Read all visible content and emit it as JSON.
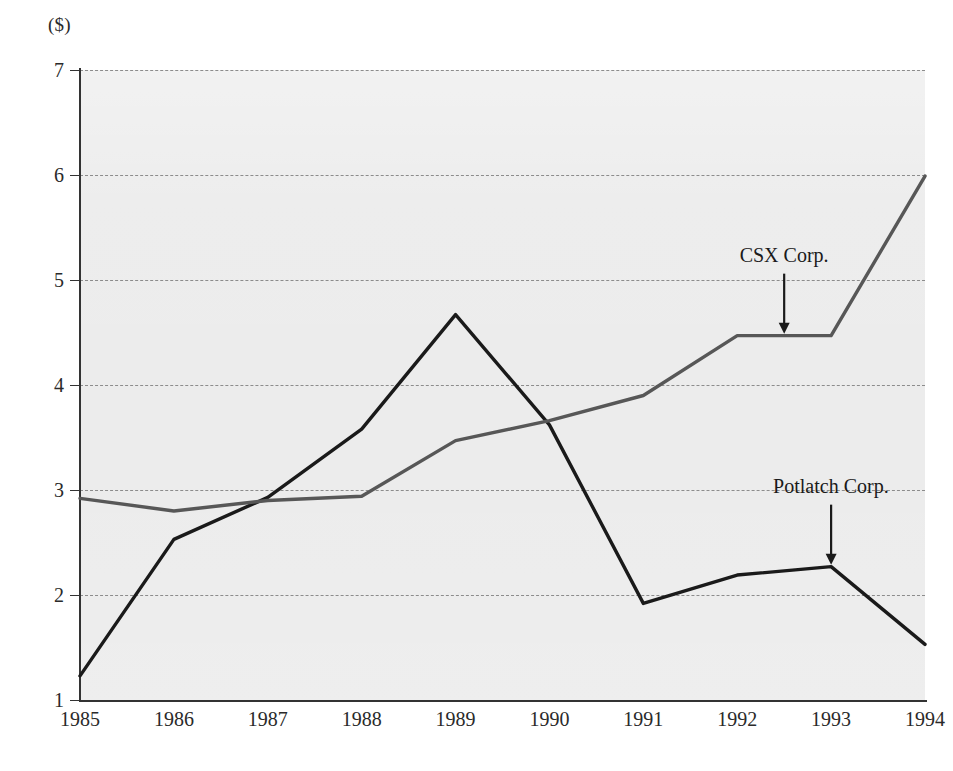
{
  "chart_data": {
    "type": "line",
    "title": "",
    "subtitle": "",
    "xlabel": "",
    "ylabel": "($)",
    "y_unit_label": "($)",
    "categories": [
      "1985",
      "1986",
      "1987",
      "1988",
      "1989",
      "1990",
      "1991",
      "1992",
      "1993",
      "1994"
    ],
    "x": [
      1985,
      1986,
      1987,
      1988,
      1989,
      1990,
      1991,
      1992,
      1993,
      1994
    ],
    "xlim": [
      1985,
      1994
    ],
    "ylim": [
      1,
      7
    ],
    "y_ticks": [
      1,
      2,
      3,
      4,
      5,
      6,
      7
    ],
    "y_tick_labels": [
      "1",
      "2",
      "3",
      "4",
      "5",
      "6",
      "7"
    ],
    "grid": true,
    "grid_style": "dashed",
    "grid_axis": "y",
    "legend": "none",
    "plot_background": "#ececec",
    "series": [
      {
        "name": "Potlatch Corp.",
        "color": "#1a1a1a",
        "values": [
          1.23,
          2.53,
          2.93,
          3.58,
          4.67,
          3.62,
          1.92,
          2.19,
          2.27,
          1.53
        ]
      },
      {
        "name": "CSX Corp.",
        "color": "#575757",
        "values": [
          2.92,
          2.8,
          2.9,
          2.94,
          3.47,
          3.66,
          3.9,
          4.47,
          4.47,
          5.99
        ]
      }
    ],
    "annotations": [
      {
        "label": "CSX Corp.",
        "target_series": "CSX Corp.",
        "target_x": 1992.5,
        "target_y": 4.47,
        "arrow": "down"
      },
      {
        "label": "Potlatch Corp.",
        "target_series": "Potlatch Corp.",
        "target_x": 1993,
        "target_y": 2.27,
        "arrow": "down"
      }
    ]
  },
  "colors": {
    "potlatch_line": "#1a1a1a",
    "csx_line": "#575757",
    "gridline": "#8c8c8c",
    "axis": "#333333",
    "plot_background": "#ececec",
    "page_background": "#ffffff",
    "text": "#2a2a2a"
  }
}
